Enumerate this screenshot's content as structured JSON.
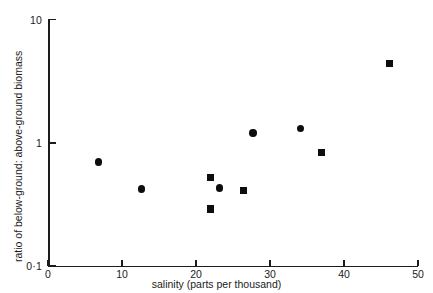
{
  "chart_data": {
    "type": "scatter",
    "title": "",
    "xlabel": "salinity (parts per thousand)",
    "ylabel": "ratio of below-ground: above-ground biomass",
    "xlim": [
      0,
      50
    ],
    "ylim": [
      0.1,
      10
    ],
    "yscale": "log",
    "xscale": "linear",
    "grid": false,
    "legend": false,
    "xticks": [
      0,
      10,
      20,
      30,
      40,
      50
    ],
    "xtick_labels": [
      "0",
      "10",
      "20",
      "30",
      "40",
      "50"
    ],
    "yticks": [
      0.1,
      1,
      10
    ],
    "ytick_labels": [
      "0·1",
      "1",
      "10"
    ],
    "series": [
      {
        "name": "circles",
        "marker": "circle",
        "color": "#0d0d0d",
        "points": [
          {
            "x": 6.8,
            "y": 0.7
          },
          {
            "x": 12.6,
            "y": 0.42
          },
          {
            "x": 23.2,
            "y": 0.43
          },
          {
            "x": 27.7,
            "y": 1.2
          },
          {
            "x": 34.1,
            "y": 1.3
          }
        ]
      },
      {
        "name": "squares",
        "marker": "square",
        "color": "#0d0d0d",
        "points": [
          {
            "x": 22.0,
            "y": 0.52
          },
          {
            "x": 22.0,
            "y": 0.29
          },
          {
            "x": 26.4,
            "y": 0.41
          },
          {
            "x": 37.0,
            "y": 0.83
          },
          {
            "x": 46.1,
            "y": 4.4
          }
        ]
      }
    ]
  }
}
